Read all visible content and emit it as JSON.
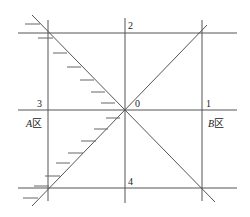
{
  "diagram": {
    "points": [
      {
        "id": "p0",
        "label": "0"
      },
      {
        "id": "p1",
        "label": "1"
      },
      {
        "id": "p2",
        "label": "2"
      },
      {
        "id": "p3",
        "label": "3"
      },
      {
        "id": "p4",
        "label": "4"
      }
    ],
    "zones": [
      {
        "id": "zoneA",
        "letter": "A",
        "suffix": "区"
      },
      {
        "id": "zoneB",
        "letter": "B",
        "suffix": "区"
      }
    ],
    "colors": {
      "line": "#555555",
      "background": "#ffffff"
    }
  }
}
